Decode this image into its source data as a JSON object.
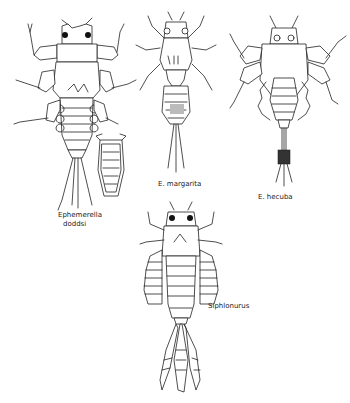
{
  "figure": {
    "specimens": [
      {
        "id": "ephemerella-doddsi",
        "label_line1": "Ephemerella",
        "label_line2": "doddsi"
      },
      {
        "id": "e-margarita",
        "label": "E. margarita"
      },
      {
        "id": "e-hecuba",
        "label": "E. hecuba"
      },
      {
        "id": "siphlonurus",
        "label": "Siphlonurus"
      }
    ]
  }
}
